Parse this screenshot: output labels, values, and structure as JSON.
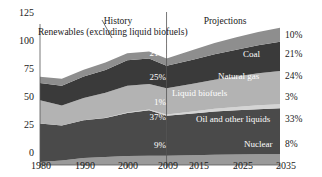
{
  "chart_data": {
    "type": "area",
    "title": "",
    "subtitle": "",
    "xlabel": "",
    "ylabel": "",
    "xlim": [
      1980,
      2035
    ],
    "ylim": [
      0,
      125
    ],
    "y_ticks": [
      0,
      25,
      50,
      75,
      100,
      125
    ],
    "x_ticks": [
      1980,
      1990,
      2000,
      2009,
      2015,
      2025,
      2035
    ],
    "x_tick_labels": [
      "1980",
      "1990",
      "2000",
      "2009",
      "2015",
      "2025",
      "2035"
    ],
    "y_tick_labels": [
      "0",
      "25",
      "50",
      "75",
      "100",
      "125"
    ],
    "grid": false,
    "legend_position": "inline-right",
    "stacked": true,
    "x": [
      1980,
      1985,
      1990,
      1995,
      2000,
      2005,
      2009,
      2015,
      2020,
      2025,
      2030,
      2035
    ],
    "series": [
      {
        "name": "Nuclear",
        "color": "#9a9a9a",
        "inline_label": "Nuclear",
        "pct_2009": "9%",
        "pct_2035": "8%",
        "values": [
          2.7,
          4.1,
          6.1,
          7.2,
          7.9,
          8.1,
          8.3,
          8.6,
          9.0,
          9.3,
          9.5,
          9.6
        ]
      },
      {
        "name": "Oil and other liquids",
        "color": "#4a4a4a",
        "inline_label": "Oil and other liquids",
        "pct_2009": "37%",
        "pct_2035": "33%",
        "values": [
          34.2,
          30.9,
          33.5,
          34.4,
          38.2,
          40.4,
          35.3,
          37.0,
          38.4,
          39.2,
          40.0,
          40.6
        ]
      },
      {
        "name": "Liquid biofuels",
        "color": "#d4d4d4",
        "inline_label": "Liquid biofuels",
        "pct_2009": "1%",
        "pct_2035": "3%",
        "values": [
          0.0,
          0.1,
          0.1,
          0.3,
          0.4,
          0.6,
          1.1,
          1.9,
          2.5,
          3.0,
          3.4,
          3.7
        ]
      },
      {
        "name": "Natural gas",
        "color": "#b3b3b3",
        "inline_label": "Natural gas",
        "pct_2009": "25%",
        "pct_2035": "24%",
        "values": [
          20.4,
          17.7,
          19.6,
          22.2,
          23.8,
          22.6,
          23.4,
          24.6,
          25.6,
          27.0,
          28.4,
          29.5
        ]
      },
      {
        "name": "Coal",
        "color": "#3a3a3a",
        "inline_label": "Coal",
        "pct_2009": "21%",
        "pct_2035": "21%",
        "values": [
          15.4,
          17.5,
          19.2,
          20.1,
          22.6,
          22.8,
          19.8,
          21.2,
          22.6,
          23.7,
          24.8,
          25.8
        ]
      },
      {
        "name": "Renewables (excluding liquid biofuels)",
        "color": "#8e8e8e",
        "inline_label": "",
        "pct_2009": "7%",
        "pct_2035": "10%",
        "values": [
          5.5,
          6.1,
          6.0,
          6.6,
          6.1,
          6.1,
          6.5,
          8.6,
          10.1,
          11.0,
          11.8,
          12.5
        ]
      }
    ],
    "annotations": {
      "history": "History",
      "projections": "Projections",
      "renewables_callout": "Renewables (excluding liquid biofuels)",
      "divider_year": 2009
    }
  },
  "axis": {
    "y_labels": [
      "125",
      "100",
      "75",
      "50",
      "25",
      "0"
    ],
    "x_labels": [
      "1980",
      "1990",
      "2000",
      "2009",
      "2015",
      "2025",
      "2035"
    ]
  },
  "right_percents": [
    {
      "label": "10%",
      "series": "Renewables (excluding liquid biofuels)"
    },
    {
      "label": "21%",
      "series": "Coal"
    },
    {
      "label": "24%",
      "series": "Natural gas"
    },
    {
      "label": "3%",
      "series": "Liquid biofuels"
    },
    {
      "label": "33%",
      "series": "Oil and other liquids"
    },
    {
      "label": "8%",
      "series": "Nuclear"
    }
  ],
  "left_percents": [
    {
      "label": "7%",
      "series": "Renewables (excluding liquid biofuels)"
    },
    {
      "label": "21%",
      "series": "Coal"
    },
    {
      "label": "25%",
      "series": "Natural gas"
    },
    {
      "label": "1%",
      "series": "Liquid biofuels"
    },
    {
      "label": "37%",
      "series": "Oil and other liquids"
    },
    {
      "label": "9%",
      "series": "Nuclear"
    }
  ],
  "inline_labels": {
    "coal": "Coal",
    "natural_gas": "Natural gas",
    "liquid_biofuels": "Liquid biofuels",
    "oil_and_other_liquids": "Oil and other liquids",
    "nuclear": "Nuclear"
  },
  "header": {
    "history": "History",
    "projections": "Projections",
    "renewables_callout": "Renewables (excluding liquid biofuels)"
  }
}
